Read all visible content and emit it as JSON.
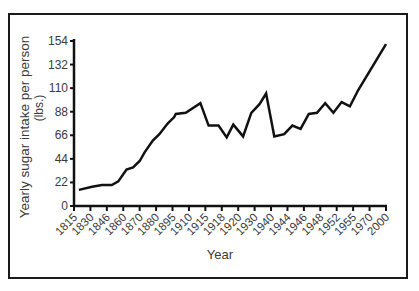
{
  "chart_data": {
    "type": "line",
    "title": "",
    "xlabel": "Year",
    "ylabel": "Yearly sugar intake per person",
    "ylabel_unit": "(lbs.)",
    "ylim": [
      0,
      154
    ],
    "yticks": [
      "0",
      "22",
      "44",
      "66",
      "88",
      "110",
      "132",
      "154"
    ],
    "categories": [
      "1815",
      "1830",
      "1846",
      "1860",
      "1870",
      "1880",
      "1895",
      "1910",
      "1915",
      "1918",
      "1920",
      "1930",
      "1940",
      "1944",
      "1946",
      "1948",
      "1952",
      "1955",
      "1970",
      "2000"
    ],
    "series": [
      {
        "name": "Yearly sugar intake per person",
        "values": [
          14,
          18,
          20,
          30,
          42,
          61,
          80,
          90,
          75,
          66,
          65,
          95,
          88,
          72,
          80,
          96,
          90,
          100,
          128,
          151
        ]
      }
    ],
    "line_points": [
      [
        0.3,
        15
      ],
      [
        1.1,
        18
      ],
      [
        1.7,
        19.6
      ],
      [
        2.3,
        19.6
      ],
      [
        2.7,
        23
      ],
      [
        3.2,
        34
      ],
      [
        3.6,
        36
      ],
      [
        4.0,
        42
      ],
      [
        4.3,
        50
      ],
      [
        4.8,
        61
      ],
      [
        5.2,
        67
      ],
      [
        5.7,
        77
      ],
      [
        6.1,
        83
      ],
      [
        6.2,
        86
      ],
      [
        6.8,
        87
      ],
      [
        7.7,
        96
      ],
      [
        8.2,
        75
      ],
      [
        8.8,
        75
      ],
      [
        9.3,
        64
      ],
      [
        9.7,
        76
      ],
      [
        10.3,
        65
      ],
      [
        10.8,
        87
      ],
      [
        11.3,
        95
      ],
      [
        11.7,
        105
      ],
      [
        12.2,
        65
      ],
      [
        12.8,
        67
      ],
      [
        13.3,
        75
      ],
      [
        13.8,
        72
      ],
      [
        14.3,
        86
      ],
      [
        14.8,
        87
      ],
      [
        15.3,
        96
      ],
      [
        15.8,
        87
      ],
      [
        16.3,
        97
      ],
      [
        16.8,
        93
      ],
      [
        17.3,
        108
      ],
      [
        19.0,
        151
      ]
    ],
    "grid": false,
    "legend": "none",
    "line_color": "#111111"
  }
}
